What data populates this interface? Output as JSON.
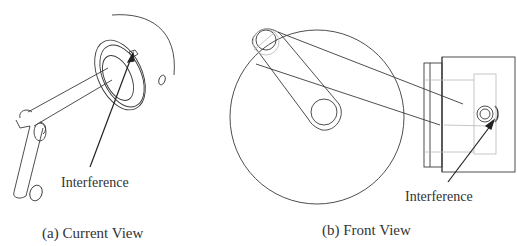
{
  "figure": {
    "panel_a": {
      "caption": "(a) Current View",
      "callout": "Interference"
    },
    "panel_b": {
      "caption": "(b) Front View",
      "callout": "Interference"
    },
    "colors": {
      "line": "#3a3a3a",
      "hidden_line": "#b8b8b8",
      "background": "#ffffff"
    }
  }
}
